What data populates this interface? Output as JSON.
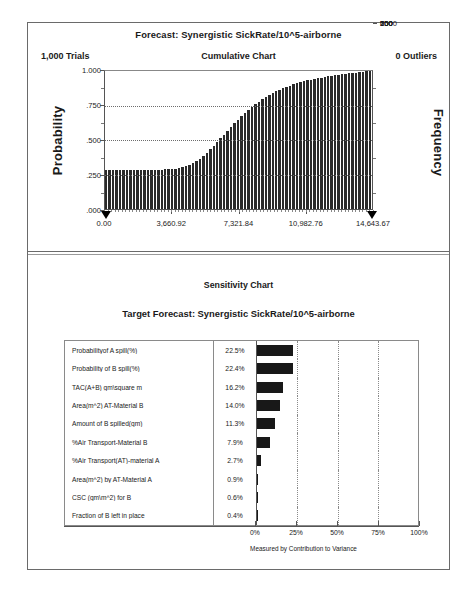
{
  "forecast_panel": {
    "title": "Forecast: Synergistic SickRate/10^5-airborne",
    "trials": "1,000 Trials",
    "chart_label": "Cumulative Chart",
    "outliers": "0 Outliers",
    "y_axis_left_title": "Probability",
    "y_axis_right_title": "Frequency"
  },
  "sensitivity_panel": {
    "title": "Sensitivity Chart",
    "subtitle": "Target Forecast:  Synergistic SickRate/10^5-airborne",
    "footer": "Measured by Contribution to Variance"
  },
  "chart_data": [
    {
      "type": "line",
      "title": "Cumulative Chart",
      "subtitle": "Forecast: Synergistic SickRate/10^5-airborne",
      "xlabel": "",
      "ylabel": "Probability",
      "y2label": "Frequency",
      "grid": true,
      "legend": "none",
      "xlim": [
        0.0,
        14643.67
      ],
      "ylim": [
        0.0,
        1.0
      ],
      "y2lim": [
        0,
        1000
      ],
      "xticks": [
        "0.00",
        "3,660.92",
        "7,321.84",
        "10,982.76",
        "14,643.67"
      ],
      "xtick_values": [
        0.0,
        3660.92,
        7321.84,
        10982.76,
        14643.67
      ],
      "yticks": [
        "1.000",
        ".750",
        ".500",
        ".250",
        ".000"
      ],
      "ytick_values": [
        1.0,
        0.75,
        0.5,
        0.25,
        0.0
      ],
      "y2ticks": [
        "1000",
        "750",
        "500",
        "250",
        "0"
      ],
      "y2tick_values": [
        1000,
        750,
        500,
        250,
        0
      ],
      "note": "Cumulative distribution drawn as ~70 vertical bars; starts at 0.28 plateau then S-curve to 1.00",
      "values": [
        0.281,
        0.281,
        0.281,
        0.281,
        0.281,
        0.282,
        0.282,
        0.282,
        0.283,
        0.283,
        0.283,
        0.284,
        0.284,
        0.284,
        0.285,
        0.285,
        0.286,
        0.287,
        0.288,
        0.29,
        0.292,
        0.296,
        0.302,
        0.31,
        0.32,
        0.333,
        0.348,
        0.366,
        0.386,
        0.408,
        0.432,
        0.458,
        0.484,
        0.511,
        0.539,
        0.566,
        0.593,
        0.62,
        0.646,
        0.671,
        0.695,
        0.718,
        0.739,
        0.759,
        0.778,
        0.795,
        0.811,
        0.826,
        0.84,
        0.853,
        0.865,
        0.876,
        0.886,
        0.895,
        0.904,
        0.912,
        0.919,
        0.926,
        0.932,
        0.938,
        0.943,
        0.948,
        0.953,
        0.957,
        0.961,
        0.965,
        0.969,
        0.972,
        0.976,
        0.979,
        0.982,
        0.985,
        0.988,
        0.991,
        0.994,
        0.997,
        1.0
      ]
    },
    {
      "type": "bar",
      "orientation": "horizontal",
      "title": "Sensitivity Chart",
      "subtitle": "Target Forecast:  Synergistic SickRate/10^5-airborne",
      "xlabel": "Measured by Contribution to Variance",
      "ylabel": "",
      "grid": true,
      "legend": "none",
      "xlim": [
        0,
        100
      ],
      "xticks": [
        "0%",
        "25%",
        "50%",
        "75%",
        "100%"
      ],
      "xtick_values": [
        0,
        25,
        50,
        75,
        100
      ],
      "categories": [
        "Probabilityof A spill(%)",
        "Probability of B spill(%)",
        "TAC(A+B) gm\\square m",
        "Area(m^2) AT-Material B",
        "Amount of B spilled(gm)",
        "%Air Transport-Material B",
        "%Air Transport(AT)-material A",
        "Area(m^2)  by AT-Material A",
        "CSC (gm\\m^2) for B",
        "Fraction of B left in place"
      ],
      "values": [
        22.5,
        22.4,
        16.2,
        14.0,
        11.3,
        7.9,
        2.7,
        0.9,
        0.6,
        0.4
      ],
      "value_labels": [
        "22.5%",
        "22.4%",
        "16.2%",
        "14.0%",
        "11.3%",
        "7.9%",
        "2.7%",
        "0.9%",
        "0.6%",
        "0.4%"
      ]
    }
  ]
}
